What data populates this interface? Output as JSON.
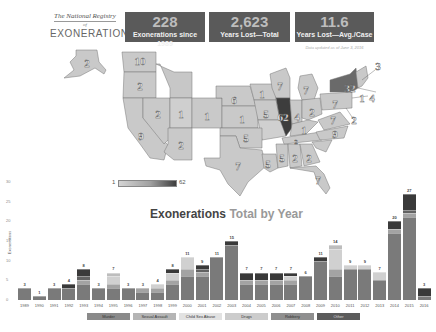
{
  "logo": {
    "line1": "The National Registry",
    "line2": "of",
    "line3": "EXONERATIONS"
  },
  "stats": [
    {
      "value": "228",
      "label": "Exonerations since 1989"
    },
    {
      "value": "2,623",
      "label": "Years Lost—Total"
    },
    {
      "value": "11.6",
      "label": "Years Lost—Avg./Case"
    }
  ],
  "updated": "Data updated as of June 3, 2016",
  "map": {
    "colorbar": {
      "min": "1",
      "max": "62"
    },
    "labels": [
      {
        "state": "AK",
        "value": "2"
      },
      {
        "state": "WA",
        "value": "10"
      },
      {
        "state": "OR",
        "value": "2"
      },
      {
        "state": "CA",
        "value": "9"
      },
      {
        "state": "NV",
        "value": "2"
      },
      {
        "state": "ID",
        "value": "1"
      },
      {
        "state": "AZ",
        "value": "2"
      },
      {
        "state": "CO",
        "value": "1"
      },
      {
        "state": "NE",
        "value": "6"
      },
      {
        "state": "KS",
        "value": "1"
      },
      {
        "state": "MN",
        "value": "1"
      },
      {
        "state": "IA",
        "value": "5"
      },
      {
        "state": "OK",
        "value": "5"
      },
      {
        "state": "TX",
        "value": "7"
      },
      {
        "state": "LA",
        "value": "5"
      },
      {
        "state": "MS",
        "value": "5"
      },
      {
        "state": "AL",
        "value": "2"
      },
      {
        "state": "GA",
        "value": "2"
      },
      {
        "state": "FL",
        "value": "7"
      },
      {
        "state": "WI",
        "value": "7"
      },
      {
        "state": "MI",
        "value": "7"
      },
      {
        "state": "IL",
        "value": "62"
      },
      {
        "state": "IN",
        "value": "4"
      },
      {
        "state": "OH",
        "value": "2"
      },
      {
        "state": "KY",
        "value": "1"
      },
      {
        "state": "TN",
        "value": "2"
      },
      {
        "state": "PA",
        "value": "7"
      },
      {
        "state": "NY",
        "value": "32"
      },
      {
        "state": "MA",
        "value": "3"
      },
      {
        "state": "CT",
        "value": "1"
      },
      {
        "state": "NJ",
        "value": "4"
      },
      {
        "state": "MD",
        "value": "2"
      },
      {
        "state": "VA",
        "value": "7"
      },
      {
        "state": "NC",
        "value": "9"
      }
    ]
  },
  "chart": {
    "title_main": "Exonerations",
    "title_sub": "Total by Year",
    "ylabel": "Exonerations"
  },
  "legend": [
    "Murder",
    "Sexual Assault",
    "Child Sex Abuse",
    "Drugs",
    "Robbery",
    "Other"
  ],
  "chart_data": {
    "type": "bar",
    "title": "Exonerations Total by Year",
    "xlabel": "",
    "ylabel": "Exonerations",
    "ylim": [
      0,
      30
    ],
    "yticks": [
      0,
      5,
      10,
      15,
      20,
      25,
      30
    ],
    "stacked": true,
    "legend_position": "bottom",
    "categories": [
      "1989",
      "1990",
      "1991",
      "1992",
      "1993",
      "1994",
      "1995",
      "1996",
      "1997",
      "1998",
      "1999",
      "2000",
      "2001",
      "2002",
      "2003",
      "2004",
      "2005",
      "2006",
      "2007",
      "2008",
      "2009",
      "2010",
      "2011",
      "2012",
      "2013",
      "2014",
      "2015",
      "2016"
    ],
    "totals": [
      3,
      1,
      3,
      4,
      8,
      3,
      7,
      3,
      3,
      4,
      8,
      11,
      9,
      11,
      15,
      7,
      7,
      7,
      7,
      6,
      11,
      14,
      9,
      9,
      7,
      20,
      27,
      3
    ],
    "series": [
      {
        "name": "Murder",
        "color": "#7a7a7a",
        "values": [
          3,
          1,
          3,
          3,
          4,
          3,
          3,
          3,
          2,
          2,
          4,
          6,
          6,
          11,
          14,
          4,
          4,
          4,
          4,
          6,
          10,
          6,
          8,
          8,
          5,
          17,
          21,
          1
        ]
      },
      {
        "name": "Sexual Assault",
        "color": "#a3a3a3",
        "values": [
          0,
          0,
          0,
          0,
          1,
          0,
          1,
          0,
          1,
          1,
          1,
          2,
          1,
          0,
          0,
          1,
          1,
          1,
          1,
          0,
          0,
          2,
          0,
          0,
          0,
          1,
          1,
          0
        ]
      },
      {
        "name": "Child Sex Abuse",
        "color": "#d0d0d0",
        "values": [
          0,
          0,
          0,
          0,
          0,
          0,
          2,
          0,
          0,
          1,
          2,
          3,
          0,
          0,
          0,
          0,
          0,
          0,
          1,
          0,
          0,
          5,
          1,
          1,
          2,
          0,
          0,
          0
        ]
      },
      {
        "name": "Drugs",
        "color": "#bdbdbd",
        "values": [
          0,
          0,
          0,
          0,
          0,
          0,
          1,
          0,
          0,
          0,
          0,
          0,
          0,
          0,
          0,
          0,
          0,
          0,
          0,
          0,
          0,
          1,
          0,
          0,
          0,
          0,
          0,
          0
        ]
      },
      {
        "name": "Robbery",
        "color": "#626262",
        "values": [
          0,
          0,
          0,
          0,
          1,
          0,
          0,
          0,
          0,
          0,
          0,
          0,
          1,
          0,
          0,
          0,
          0,
          0,
          0,
          0,
          0,
          0,
          0,
          0,
          0,
          0,
          1,
          0
        ]
      },
      {
        "name": "Other",
        "color": "#3a3a3a",
        "values": [
          0,
          0,
          0,
          1,
          2,
          0,
          0,
          0,
          0,
          0,
          1,
          0,
          1,
          0,
          1,
          2,
          2,
          2,
          1,
          0,
          1,
          0,
          0,
          0,
          0,
          2,
          4,
          2
        ]
      }
    ]
  }
}
